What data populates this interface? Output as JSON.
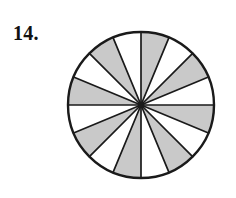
{
  "figure": {
    "label": "14.",
    "caption_visible": false,
    "colors": {
      "shaded_fill": "#c9c9c9",
      "unshaded_fill": "#ffffff",
      "stroke": "#1a1a1a",
      "background": "#ffffff",
      "label_color": "#111111"
    },
    "geometry": {
      "center_x": 79,
      "center_y": 81,
      "radius": 73,
      "outline_width": 2.4,
      "spoke_width": 1.7,
      "hub_radius": 3.2,
      "start_angle_deg": -90
    },
    "chart_data": {
      "type": "pie",
      "title": "",
      "total_sectors": 16,
      "sector_angle_deg": 22.5,
      "shaded_count": 8,
      "unshaded_count": 8,
      "fraction_shaded": "8/16",
      "pattern": "alternating",
      "categories": [
        "sector-1",
        "sector-2",
        "sector-3",
        "sector-4",
        "sector-5",
        "sector-6",
        "sector-7",
        "sector-8",
        "sector-9",
        "sector-10",
        "sector-11",
        "sector-12",
        "sector-13",
        "sector-14",
        "sector-15",
        "sector-16"
      ],
      "values": [
        6.25,
        6.25,
        6.25,
        6.25,
        6.25,
        6.25,
        6.25,
        6.25,
        6.25,
        6.25,
        6.25,
        6.25,
        6.25,
        6.25,
        6.25,
        6.25
      ],
      "shaded": [
        true,
        false,
        true,
        false,
        true,
        false,
        true,
        false,
        true,
        false,
        true,
        false,
        true,
        false,
        true,
        false
      ],
      "legend": [],
      "grid": false
    }
  }
}
